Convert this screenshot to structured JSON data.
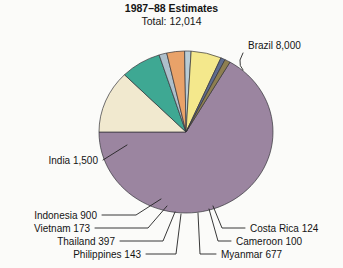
{
  "chart_data": {
    "type": "pie",
    "title": "1987–88 Estimates",
    "subtitle": "Total: 12,014",
    "total": 12014,
    "units": "",
    "legend": "labels-with-leader-lines",
    "grid": false,
    "categories": [
      "Brazil",
      "India",
      "Indonesia",
      "Vietnam",
      "Thailand",
      "Philippines",
      "Myanmar",
      "Cameroon",
      "Costa Rica"
    ],
    "values": [
      8000,
      1500,
      900,
      173,
      397,
      143,
      677,
      100,
      124
    ],
    "labels": [
      "Brazil 8,000",
      "India 1,500",
      "Indonesia 900",
      "Vietnam 173",
      "Thailand 397",
      "Philippines 143",
      "Myanmar 677",
      "Cameroon 100",
      "Costa Rica 124"
    ],
    "colors": [
      "#9b85a0",
      "#f1e9cf",
      "#3ea893",
      "#adbfcb",
      "#e9a269",
      "#b9ccd6",
      "#f4e88c",
      "#5f6c8e",
      "#8e7f50"
    ],
    "slices": [
      {
        "name": "Brazil",
        "label": "Brazil 8,000",
        "value": 8000,
        "color": "#9b85a0",
        "start_deg": 180,
        "end_deg": 419.7
      },
      {
        "name": "India",
        "label": "India 1,500",
        "value": 1500,
        "color": "#f1e9cf",
        "start_deg": 135.0,
        "end_deg": 180
      },
      {
        "name": "Indonesia",
        "label": "Indonesia 900",
        "value": 900,
        "color": "#3ea893",
        "start_deg": 108.0,
        "end_deg": 135.0
      },
      {
        "name": "Vietnam",
        "label": "Vietnam 173",
        "value": 173,
        "color": "#adbfcb",
        "start_deg": 102.8,
        "end_deg": 108.0
      },
      {
        "name": "Thailand",
        "label": "Thailand 397",
        "value": 397,
        "color": "#e9a269",
        "start_deg": 90.9,
        "end_deg": 102.8
      },
      {
        "name": "Philippines",
        "label": "Philippines 143",
        "value": 143,
        "color": "#b9ccd6",
        "start_deg": 86.6,
        "end_deg": 90.9
      },
      {
        "name": "Myanmar",
        "label": "Myanmar 677",
        "value": 677,
        "color": "#f4e88c",
        "start_deg": 66.3,
        "end_deg": 86.6
      },
      {
        "name": "Cameroon",
        "label": "Cameroon 100",
        "value": 100,
        "color": "#5f6c8e",
        "start_deg": 63.3,
        "end_deg": 66.3
      },
      {
        "name": "Costa Rica",
        "label": "Costa Rica 124",
        "value": 124,
        "color": "#8e7f50",
        "start_deg": 59.6,
        "end_deg": 63.3
      }
    ],
    "geometry": {
      "cx": 186,
      "cy": 132,
      "rx": 87,
      "ry": 81
    }
  },
  "annotations": {
    "brazil": "Brazil 8,000",
    "india": "India 1,500",
    "indonesia": "Indonesia 900",
    "vietnam": "Vietnam 173",
    "thailand": "Thailand 397",
    "philippines": "Philippines 143",
    "myanmar": "Myanmar 677",
    "cameroon": "Cameroon 100",
    "costa_rica": "Costa Rica 124"
  }
}
